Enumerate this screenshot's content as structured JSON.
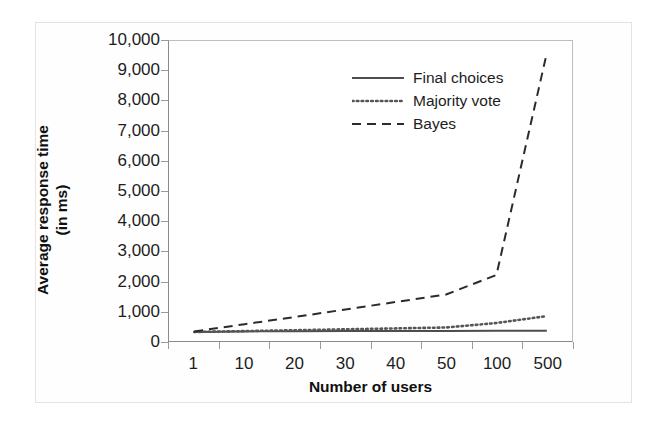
{
  "chart_data": {
    "type": "line",
    "title": "",
    "xlabel": "Number of users",
    "ylabel": "Average response time (in ms)",
    "ylabel_line1": "Average response time",
    "ylabel_line2": "(in ms)",
    "categories": [
      "1",
      "10",
      "20",
      "30",
      "40",
      "50",
      "100",
      "500"
    ],
    "ytick_labels": [
      "10,000",
      "9,000",
      "8,000",
      "7,000",
      "6,000",
      "5,000",
      "4,000",
      "3,000",
      "2,000",
      "1,000",
      "0"
    ],
    "ytick_values": [
      10000,
      9000,
      8000,
      7000,
      6000,
      5000,
      4000,
      3000,
      2000,
      1000,
      0
    ],
    "ylim": [
      0,
      10000
    ],
    "grid": false,
    "legend_position": "inside-top-center",
    "series": [
      {
        "name": "Final choices",
        "style": "solid",
        "color": "#4d4d4d",
        "values": [
          300,
          320,
          325,
          330,
          330,
          335,
          340,
          340
        ]
      },
      {
        "name": "Majority vote",
        "style": "dotted",
        "color": "#565656",
        "values": [
          300,
          330,
          360,
          390,
          420,
          450,
          600,
          830
        ]
      },
      {
        "name": "Bayes",
        "style": "dashed",
        "color": "#2b2b2b",
        "values": [
          320,
          560,
          800,
          1050,
          1300,
          1550,
          2200,
          9600
        ]
      }
    ]
  },
  "legend": {
    "items": [
      {
        "label": "Final choices",
        "style": "solid"
      },
      {
        "label": "Majority vote",
        "style": "dotted"
      },
      {
        "label": "Bayes",
        "style": "dashed"
      }
    ]
  }
}
